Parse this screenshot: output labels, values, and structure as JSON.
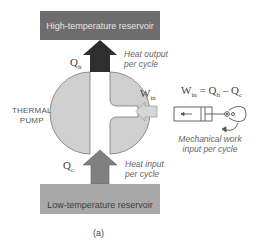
{
  "diagram": {
    "high_reservoir": {
      "label": "High-temperature reservoir",
      "color": "#6d6d6d"
    },
    "low_reservoir": {
      "label": "Low-temperature reservoir",
      "color": "#a9a9a9"
    },
    "pump": {
      "label_line1": "THERMAL",
      "label_line2": "PUMP",
      "fill": "#cfcfcf"
    },
    "heat_output": {
      "symbol": "Q",
      "subscript": "h",
      "label_line1": "Heat output",
      "label_line2": "per cycle",
      "arrow_color": "#2e2e2e"
    },
    "heat_input": {
      "symbol": "Q",
      "subscript": "c",
      "label_line1": "Heat input",
      "label_line2": "per cycle",
      "arrow_color": "#808080"
    },
    "work_input": {
      "symbol": "W",
      "subscript": "in",
      "arrow_color": "#d6d6d6"
    },
    "equation": {
      "lhs": "W",
      "lhs_sub": "in",
      "eq": " = ",
      "q1": "Q",
      "q1_sub": "h",
      "minus": " – ",
      "q2": "Q",
      "q2_sub": "c"
    },
    "mechanical": {
      "label_line1": "Mechanical work",
      "label_line2": "input per cycle"
    },
    "caption": "(a)"
  }
}
